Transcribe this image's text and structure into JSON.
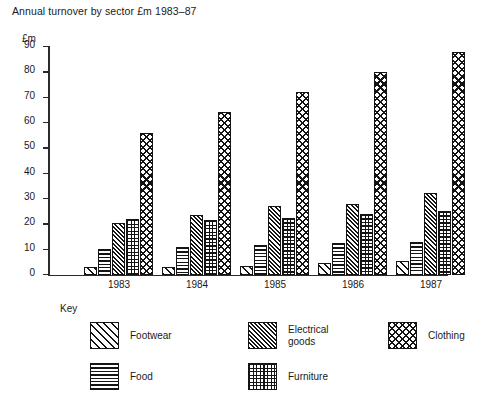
{
  "chart_data": {
    "type": "bar",
    "title": "Annual turnover by sector £m 1983–87",
    "xlabel": "",
    "ylabel": "£m",
    "ylim": [
      0,
      90
    ],
    "yticks": [
      90,
      80,
      70,
      60,
      50,
      40,
      30,
      20,
      10,
      0
    ],
    "grid": false,
    "legend_position": "below-plot",
    "categories": [
      "1983",
      "1984",
      "1985",
      "1986",
      "1987"
    ],
    "series": [
      {
        "name": "Footwear",
        "pattern": "diagonal-hatch-wide",
        "values": [
          3,
          3,
          3.5,
          4.5,
          5.5
        ]
      },
      {
        "name": "Food",
        "pattern": "horizontal-lines",
        "values": [
          10,
          11,
          11.5,
          12.5,
          13
        ]
      },
      {
        "name": "Electrical goods",
        "pattern": "diagonal-hatch-dense",
        "values": [
          20.5,
          23.5,
          27,
          28,
          32
        ]
      },
      {
        "name": "Furniture",
        "pattern": "grid",
        "values": [
          22,
          21.5,
          22.5,
          24,
          25
        ]
      },
      {
        "name": "Clothing",
        "pattern": "cross-hatch-diamond",
        "values": [
          56,
          64,
          72,
          80,
          88
        ]
      }
    ]
  },
  "axis": {
    "unit_label": "£m",
    "tick_labels": [
      "90",
      "80",
      "70",
      "60",
      "50",
      "40",
      "30",
      "20",
      "10",
      "0"
    ],
    "category_labels": [
      "1983",
      "1984",
      "1985",
      "1986",
      "1987"
    ]
  },
  "key": {
    "title": "Key",
    "items": [
      {
        "label": "Footwear",
        "name": "footwear"
      },
      {
        "label": "Food",
        "name": "food"
      },
      {
        "label": "Electrical\ngoods",
        "name": "electrical-goods"
      },
      {
        "label": "Furniture",
        "name": "furniture"
      },
      {
        "label": "Clothing",
        "name": "clothing"
      }
    ]
  },
  "colors": {
    "ink": "#141414",
    "axis": "#2b2b2b",
    "background": "#ffffff"
  }
}
